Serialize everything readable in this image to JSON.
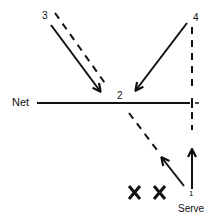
{
  "diagram": {
    "type": "volleyball-play-diagram",
    "labels": {
      "net": "Net",
      "position_1": "1",
      "position_2": "2",
      "position_3": "3",
      "position_4": "4",
      "serve": "Serve",
      "opponent_1": "X",
      "opponent_2": "X"
    },
    "elements": [
      {
        "kind": "line",
        "style": "solid",
        "role": "net",
        "label": "Net"
      },
      {
        "kind": "arrow",
        "style": "solid",
        "from": "3",
        "to": "2"
      },
      {
        "kind": "line",
        "style": "dashed",
        "from": "3",
        "to": "2"
      },
      {
        "kind": "arrow",
        "style": "solid",
        "from": "4",
        "to": "2"
      },
      {
        "kind": "line",
        "style": "dashed",
        "from": "4",
        "to": "1",
        "orientation": "vertical"
      },
      {
        "kind": "line",
        "style": "dashed",
        "from": "2",
        "to": "1"
      },
      {
        "kind": "arrow",
        "style": "solid",
        "from": "1",
        "direction": "up-left"
      },
      {
        "kind": "arrow",
        "style": "solid",
        "from": "1",
        "direction": "up"
      }
    ],
    "colors": {
      "ink": "#111111",
      "background": "#ffffff"
    }
  }
}
